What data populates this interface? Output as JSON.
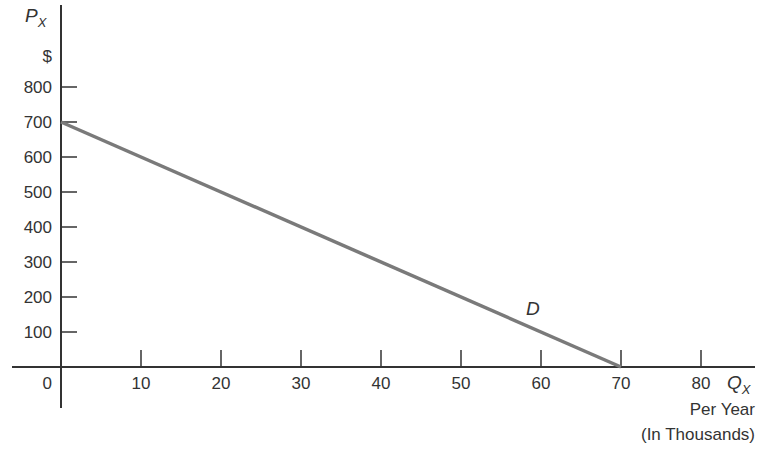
{
  "chart_data": {
    "type": "line",
    "title": "",
    "xlabel": "Q_X Per Year (In Thousands)",
    "ylabel": "P_X $",
    "x_ticks": [
      0,
      10,
      20,
      30,
      40,
      50,
      60,
      70,
      80
    ],
    "y_ticks": [
      100,
      200,
      300,
      400,
      500,
      600,
      700,
      800
    ],
    "xlim": [
      0,
      80
    ],
    "ylim": [
      0,
      800
    ],
    "grid": false,
    "series": [
      {
        "name": "D",
        "x": [
          0,
          70
        ],
        "y": [
          700,
          0
        ],
        "color": "#7a7a7a"
      }
    ],
    "annotations": [
      {
        "text": "D",
        "x": 59,
        "y": 115
      }
    ]
  },
  "labels": {
    "y_axis_main": "P",
    "y_axis_sub": "X",
    "y_unit": "$",
    "x_axis_main": "Q",
    "x_axis_sub": "X",
    "x_unit_line1": "Per Year",
    "x_unit_line2": "(In Thousands)",
    "origin": "0",
    "curve_label": "D"
  },
  "colors": {
    "axis": "#333333",
    "curve": "#7a7a7a",
    "text": "#333333"
  }
}
